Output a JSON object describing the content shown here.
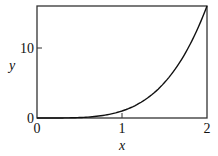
{
  "chart_data": {
    "type": "line",
    "title": "",
    "xlabel": "x",
    "ylabel": "y",
    "xlim": [
      0,
      2
    ],
    "ylim": [
      0,
      16
    ],
    "x_ticks": [
      "0",
      "1",
      "2"
    ],
    "y_ticks": [
      "0",
      "10"
    ],
    "grid": false,
    "legend": null,
    "series": [
      {
        "name": "y = x^4",
        "x": [
          0,
          0.25,
          0.5,
          0.75,
          1.0,
          1.25,
          1.5,
          1.75,
          2.0
        ],
        "values": [
          0,
          0.004,
          0.0625,
          0.316,
          1.0,
          2.44,
          5.06,
          9.38,
          16.0
        ]
      }
    ],
    "colors": {
      "line": "#111111",
      "axes": "#333333"
    }
  }
}
